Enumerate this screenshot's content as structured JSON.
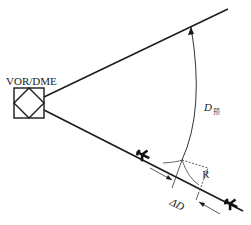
{
  "diagram": {
    "station": {
      "label": "VOR/DME",
      "icon": "vor-dme-station-icon"
    },
    "labels": {
      "distance_prefix": "D",
      "distance_subscript": "预",
      "radius": "R",
      "delta_distance": "ΔD"
    },
    "elements": {
      "upper_radial": "outbound radial to upper right",
      "lower_radial": "inbound track to lower right",
      "arc": "DME arc with arrow toward upper radial",
      "aircraft": [
        "aircraft-on-track-near",
        "aircraft-on-track-far"
      ]
    },
    "colors": {
      "line": "#1a1a1a",
      "dashed": "#333333",
      "background": "#ffffff"
    }
  }
}
